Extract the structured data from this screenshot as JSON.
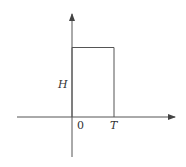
{
  "diagram": {
    "type": "rectangular-pulse",
    "labels": {
      "height": "H",
      "origin": "0",
      "end": "T"
    },
    "colors": {
      "line": "#555555",
      "text": "#333333",
      "background": "#ffffff"
    }
  }
}
